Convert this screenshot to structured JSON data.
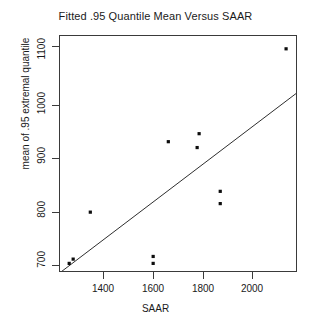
{
  "chart_data": {
    "type": "scatter",
    "title": "Fitted .95 Quantile Mean Versus SAAR",
    "xlabel": "SAAR",
    "ylabel": "mean of .95 extremal quantile",
    "xlim": [
      1226,
      2184
    ],
    "ylim": [
      693,
      1137
    ],
    "xticks": [
      1400,
      1600,
      1800,
      2000
    ],
    "yticks": [
      700,
      800,
      900,
      1000,
      1100
    ],
    "grid": false,
    "legend": null,
    "point_color": "#0d0d0d",
    "line_color": "#2e2e2e",
    "x": [
      1263,
      1279,
      1348,
      1601,
      1601,
      1662,
      1778,
      1786,
      1871,
      1871,
      2136
    ],
    "y": [
      711,
      719,
      807,
      711,
      724,
      939,
      928,
      954,
      823,
      846,
      1113
    ],
    "points": [
      {
        "x": 1263,
        "y": 711
      },
      {
        "x": 1279,
        "y": 719
      },
      {
        "x": 1348,
        "y": 807
      },
      {
        "x": 1601,
        "y": 711
      },
      {
        "x": 1601,
        "y": 724
      },
      {
        "x": 1662,
        "y": 939
      },
      {
        "x": 1778,
        "y": 928
      },
      {
        "x": 1786,
        "y": 954
      },
      {
        "x": 1871,
        "y": 823
      },
      {
        "x": 1871,
        "y": 846
      },
      {
        "x": 2136,
        "y": 1113
      }
    ],
    "reference_line": {
      "name": "one-to-one-line",
      "x0": 1230,
      "y0": 695,
      "x1": 2184,
      "y1": 1032
    }
  },
  "labels": {
    "title": "Fitted .95 Quantile Mean Versus SAAR",
    "xlabel": "SAAR",
    "ylabel": "mean of .95 extremal quantile",
    "ytick_700": "700",
    "ytick_800": "800",
    "ytick_900": "900",
    "ytick_1000": "1000",
    "ytick_1100": "1100",
    "xtick_1400": "1400",
    "xtick_1600": "1600",
    "xtick_1800": "1800",
    "xtick_2000": "2000"
  }
}
